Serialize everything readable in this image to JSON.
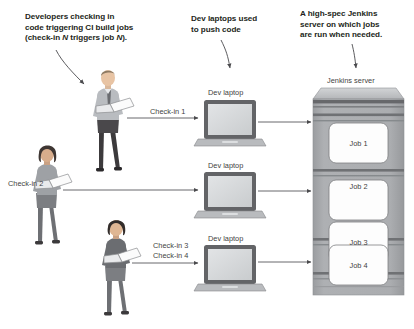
{
  "diagram": {
    "annotations": [
      {
        "id": "developers-note",
        "line1": "Developers checking in",
        "line2": "code triggering CI build jobs",
        "line3_a": "(check-in ",
        "line3_i1": "N",
        "line3_b": " triggers job ",
        "line3_i2": "N",
        "line3_c": ")."
      },
      {
        "id": "laptops-note",
        "line1": "Dev laptops used",
        "line2": "to push code"
      },
      {
        "id": "server-note",
        "line1": "A high-spec Jenkins",
        "line2": "server on which jobs",
        "line3": "are run when needed."
      }
    ],
    "server": {
      "caption": "Jenkins server",
      "jobs": [
        "Job 1",
        "Job 2",
        "Job 3",
        "Job 4"
      ]
    },
    "rows": [
      {
        "checkins": [
          "Check-in 1"
        ],
        "laptop_label": "Dev laptop",
        "person": "developer-standing-male"
      },
      {
        "checkins": [
          "Check-in 2"
        ],
        "laptop_label": "Dev laptop",
        "person": "developer-standing-female"
      },
      {
        "checkins": [
          "Check-in 3",
          "Check-in 4"
        ],
        "laptop_label": "Dev laptop",
        "person": "developer-standing-person"
      }
    ],
    "colors": {
      "text": "#231f20",
      "label": "#3f3f42",
      "line": "#58585b",
      "server_body": "#a7a9ac",
      "server_top": "#c9cbcd",
      "server_band": "#6d6e71",
      "laptop_bezel": "#636467",
      "laptop_screen": "#d6d8da",
      "job_box": "#fdfdfd"
    }
  }
}
